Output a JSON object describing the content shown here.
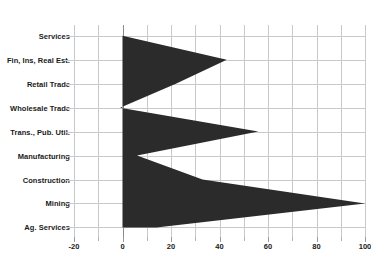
{
  "chart_data": {
    "type": "area",
    "title": "",
    "subtitle": "",
    "xlabel": "",
    "ylabel": "",
    "orientation": "horizontal",
    "grid": true,
    "legend": "none",
    "xlim": [
      -20,
      100
    ],
    "xticks": [
      -20,
      0,
      20,
      40,
      60,
      80,
      100
    ],
    "xtick_labels": [
      "-20",
      "0",
      "20",
      "40",
      "60",
      "80",
      "100"
    ],
    "xminor_step": 10,
    "categories": [
      "Services",
      "Fin, Ins, Real Est.",
      "Retail Trade",
      "Wholesale Trade",
      "Trans., Pub. Util.",
      "Manufacturing",
      "Construction",
      "Mining",
      "Ag. Services"
    ],
    "values": [
      0,
      43,
      22,
      -1,
      56,
      6,
      33,
      100,
      14
    ],
    "baseline": 0,
    "series": [
      {
        "name": "",
        "values": [
          0,
          43,
          22,
          -1,
          56,
          6,
          33,
          100,
          14
        ]
      }
    ],
    "fill_color": "#2b2b2b",
    "grid_color": "#c9c9c9",
    "axis_color": "#8a8a8a",
    "background": "#ffffff"
  }
}
